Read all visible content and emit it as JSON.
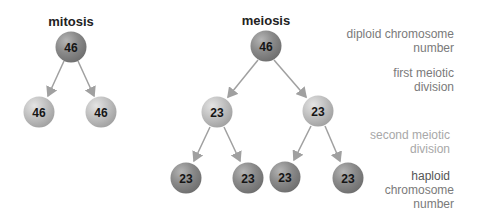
{
  "titles": {
    "mitosis": "mitosis",
    "meiosis": "meiosis"
  },
  "mitosis": {
    "parent": "46",
    "children": [
      "46",
      "46"
    ]
  },
  "meiosis": {
    "parent": "46",
    "first_division": [
      "23",
      "23"
    ],
    "second_division": [
      "23",
      "23",
      "23",
      "23"
    ]
  },
  "labels": {
    "diploid": [
      "diploid chromosome",
      "number"
    ],
    "first": [
      "first meiotic",
      "division"
    ],
    "second": [
      "second meiotic",
      "division"
    ],
    "haploid": [
      "haploid",
      "chromosome",
      "number"
    ]
  },
  "colors": {
    "sphere_dark": "#7a7a7a",
    "sphere_light": "#bdbdbd",
    "arrow": "#9a9a9a",
    "label_text": "#7a7a7a"
  }
}
